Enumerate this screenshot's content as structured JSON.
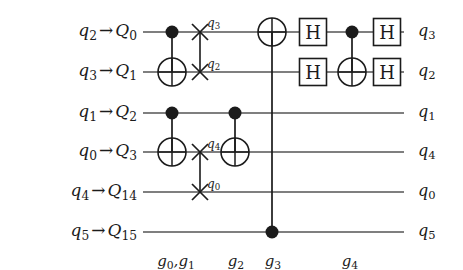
{
  "figure": {
    "type": "quantum-circuit-diagram",
    "background_color": "#ffffff",
    "wire_color": "#555555",
    "gate_color": "#1b1b1b"
  },
  "wires": [
    {
      "id": "w0",
      "left_label": {
        "logical": "q",
        "logical_sub": "2",
        "arrow": "→",
        "physical": "Q",
        "physical_sub": "0"
      },
      "right_label": {
        "q": "q",
        "sub": "3"
      },
      "y": 32
    },
    {
      "id": "w1",
      "left_label": {
        "logical": "q",
        "logical_sub": "3",
        "arrow": "→",
        "physical": "Q",
        "physical_sub": "1"
      },
      "right_label": {
        "q": "q",
        "sub": "2"
      },
      "y": 72
    },
    {
      "id": "w2",
      "left_label": {
        "logical": "q",
        "logical_sub": "1",
        "arrow": "→",
        "physical": "Q",
        "physical_sub": "2"
      },
      "right_label": {
        "q": "q",
        "sub": "1"
      },
      "y": 113
    },
    {
      "id": "w3",
      "left_label": {
        "logical": "q",
        "logical_sub": "0",
        "arrow": "→",
        "physical": "Q",
        "physical_sub": "3"
      },
      "right_label": {
        "q": "q",
        "sub": "4"
      },
      "y": 152
    },
    {
      "id": "w4",
      "left_label": {
        "logical": "q",
        "logical_sub": "4",
        "arrow": "→",
        "physical": "Q",
        "physical_sub": "14"
      },
      "right_label": {
        "q": "q",
        "sub": "0"
      },
      "y": 192
    },
    {
      "id": "w5",
      "left_label": {
        "logical": "q",
        "logical_sub": "5",
        "arrow": "→",
        "physical": "Q",
        "physical_sub": "15"
      },
      "right_label": {
        "q": "q",
        "sub": "5"
      },
      "y": 232
    }
  ],
  "swap_labels": [
    {
      "id": "swap-label-q3",
      "q": "q",
      "sub": "3",
      "x": 207,
      "y": 17
    },
    {
      "id": "swap-label-q2",
      "q": "q",
      "sub": "2",
      "x": 207,
      "y": 58
    },
    {
      "id": "swap-label-q4",
      "q": "q",
      "sub": "4",
      "x": 207,
      "y": 138
    },
    {
      "id": "swap-label-q0",
      "q": "q",
      "sub": "0",
      "x": 207,
      "y": 178
    }
  ],
  "step_labels": [
    {
      "id": "step-g0-g1",
      "text": "g",
      "sub": "0",
      "text2": ",g",
      "sub2": "1",
      "x": 176,
      "y": 254
    },
    {
      "id": "step-g2",
      "text": "g",
      "sub": "2",
      "text2": "",
      "sub2": "",
      "x": 236,
      "y": 254
    },
    {
      "id": "step-g3",
      "text": "g",
      "sub": "3",
      "text2": "",
      "sub2": "",
      "x": 273,
      "y": 254
    },
    {
      "id": "step-g4",
      "text": "g",
      "sub": "4",
      "text2": "",
      "sub2": "",
      "x": 350,
      "y": 254
    }
  ],
  "gates": [
    {
      "name": "cnot-g0",
      "type": "cnot",
      "control_y": 32,
      "target_y": 72,
      "x": 172,
      "step": "g0"
    },
    {
      "name": "cnot-g1",
      "type": "cnot",
      "control_y": 113,
      "target_y": 152,
      "x": 172,
      "step": "g1"
    },
    {
      "name": "swap-q0-q1",
      "type": "swap",
      "y1": 32,
      "y2": 72,
      "x": 200,
      "step": "g0"
    },
    {
      "name": "swap-q3-q14",
      "type": "swap",
      "y1": 152,
      "y2": 192,
      "x": 200,
      "step": "g1"
    },
    {
      "name": "cnot-g2",
      "type": "cnot",
      "control_y": 113,
      "target_y": 152,
      "x": 235,
      "step": "g2"
    },
    {
      "name": "cnot-g3",
      "type": "cnot",
      "control_y": 232,
      "target_y": 32,
      "x": 272,
      "step": "g3"
    },
    {
      "name": "hadamard-q0-first",
      "type": "h",
      "label": "H",
      "y": 32,
      "x": 313,
      "step": "g4"
    },
    {
      "name": "hadamard-q1-first",
      "type": "h",
      "label": "H",
      "y": 72,
      "x": 313,
      "step": "g4"
    },
    {
      "name": "cnot-g4",
      "type": "cnot",
      "control_y": 32,
      "target_y": 72,
      "x": 352,
      "step": "g4"
    },
    {
      "name": "hadamard-q0-second",
      "type": "h",
      "label": "H",
      "y": 32,
      "x": 387,
      "step": "g4"
    },
    {
      "name": "hadamard-q1-second",
      "type": "h",
      "label": "H",
      "y": 72,
      "x": 387,
      "step": "g4"
    }
  ],
  "geometry": {
    "wire_start_x": 143,
    "wire_end_x": 404,
    "left_label_x": 25,
    "right_label_x": 418,
    "h_box_size": 27,
    "dot_radius": 6.5,
    "circle_radius": 14,
    "swap_arm": 8
  }
}
